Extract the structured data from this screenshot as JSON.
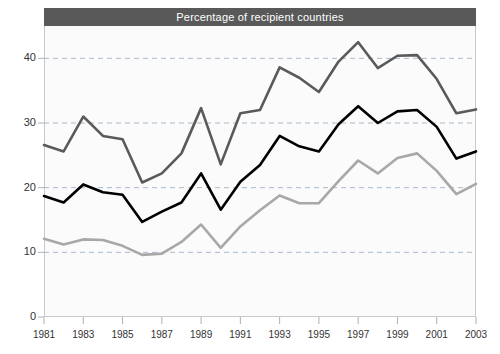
{
  "chart": {
    "title": "Percentage of recipient countries",
    "colors": {
      "title_bar": "#595959",
      "title_text": "#ffffff",
      "series_dark_gray": "#5a5a5a",
      "series_black": "#000000",
      "series_light_gray": "#a8a8a8",
      "grid": "#a9b8c9",
      "axis": "#b0b0b0",
      "plot_background": "#fbfbfb"
    }
  },
  "chart_data": {
    "type": "line",
    "title": "Percentage of recipient countries",
    "xlabel": "",
    "ylabel": "",
    "xlim": [
      1981,
      2003
    ],
    "ylim": [
      0,
      45
    ],
    "yticks": [
      0,
      10,
      20,
      30,
      40
    ],
    "ytick_labels": [
      "0",
      "10",
      "20",
      "30",
      "40"
    ],
    "xticks": [
      1981,
      1983,
      1985,
      1987,
      1989,
      1991,
      1993,
      1995,
      1997,
      1999,
      2001,
      2003
    ],
    "xtick_labels": [
      "1981",
      "1983",
      "1985",
      "1987",
      "1989",
      "1991",
      "1993",
      "1995",
      "1997",
      "1999",
      "2001",
      "2003"
    ],
    "grid": "horizontal-dashed",
    "legend": "none",
    "x": [
      1981,
      1982,
      1983,
      1984,
      1985,
      1986,
      1987,
      1988,
      1989,
      1990,
      1991,
      1992,
      1993,
      1994,
      1995,
      1996,
      1997,
      1998,
      1999,
      2000,
      2001,
      2002,
      2003
    ],
    "series": [
      {
        "name": "upper",
        "color": "#5a5a5a",
        "values": [
          26.6,
          25.6,
          31.0,
          28.0,
          27.5,
          20.8,
          22.2,
          25.3,
          32.3,
          23.6,
          31.5,
          32.0,
          38.6,
          37.0,
          34.8,
          39.5,
          42.5,
          38.5,
          40.4,
          40.5,
          36.8,
          31.5,
          32.1
        ]
      },
      {
        "name": "middle",
        "color": "#000000",
        "values": [
          18.7,
          17.7,
          20.5,
          19.3,
          18.9,
          14.7,
          16.3,
          17.7,
          22.2,
          16.6,
          20.9,
          23.5,
          28.0,
          26.4,
          25.6,
          29.8,
          32.6,
          30.0,
          31.8,
          32.0,
          29.4,
          24.5,
          25.6
        ]
      },
      {
        "name": "lower",
        "color": "#a8a8a8",
        "values": [
          12.1,
          11.2,
          12.0,
          11.9,
          11.0,
          9.6,
          9.8,
          11.6,
          14.3,
          10.7,
          14.0,
          16.5,
          18.8,
          17.6,
          17.6,
          21.0,
          24.2,
          22.2,
          24.6,
          25.3,
          22.6,
          19.0,
          20.6
        ]
      }
    ]
  }
}
